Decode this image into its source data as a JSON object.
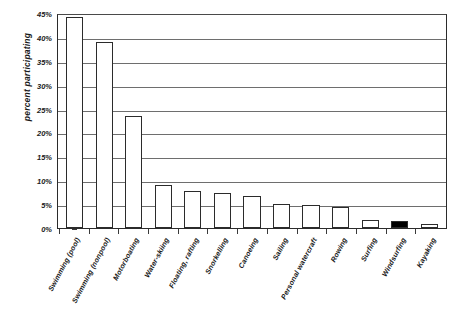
{
  "chart_data": {
    "type": "bar",
    "title": "",
    "subtitle": "",
    "xlabel": "",
    "ylabel": "percent participating",
    "ylim": [
      0,
      45
    ],
    "grid": true,
    "legend": "none",
    "y_tick_labels": [
      "45%",
      "40%",
      "35%",
      "30%",
      "25%",
      "20%",
      "15%",
      "10%",
      "5%",
      "0%"
    ],
    "y_tick_values": [
      45,
      40,
      35,
      30,
      25,
      20,
      15,
      10,
      5,
      0
    ],
    "value_suffix": "%",
    "categories": [
      "Swimming (pool)",
      "Swimming (nonpool)",
      "Motorboating",
      "Water-skiing",
      "Floating, rafting",
      "Snorkelling",
      "Canoeing",
      "Sailing",
      "Personal watercraft",
      "Rowing",
      "Surfing",
      "Windsurfing",
      "Kayaking"
    ],
    "values": [
      44.2,
      39.0,
      23.5,
      9.0,
      7.7,
      7.3,
      6.8,
      5.1,
      4.9,
      4.5,
      1.6,
      1.5,
      0.9
    ],
    "bar_styles": [
      "outline",
      "outline",
      "outline",
      "outline",
      "outline",
      "outline",
      "outline",
      "outline",
      "outline",
      "outline",
      "outline",
      "filled",
      "outline"
    ],
    "colors": {
      "bar_fill": "#ffffff",
      "bar_fill_highlight": "#000000",
      "bar_stroke": "#2b2b2b",
      "gridline": "#6e6e6e",
      "axis": "#2b2b2b",
      "text": "#1a1a1a",
      "background": "#ffffff"
    }
  }
}
